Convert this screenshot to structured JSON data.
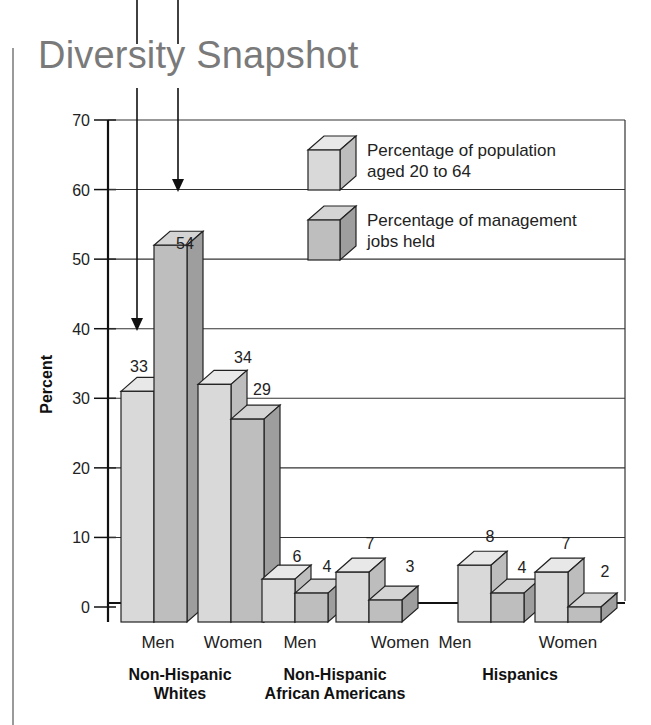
{
  "title": "Diversity Snapshot",
  "colors": {
    "pop_front": "#d9d9d9",
    "pop_top": "#e8e8e8",
    "pop_side": "#bdbdbd",
    "mgmt_front": "#bebebe",
    "mgmt_top": "#d4d4d4",
    "mgmt_side": "#9e9e9e",
    "stroke": "#222222"
  },
  "legend": [
    {
      "label_line1": "Percentage of population",
      "label_line2": "aged 20 to 64",
      "series": "population"
    },
    {
      "label_line1": "Percentage of management",
      "label_line2": "jobs held",
      "series": "management"
    }
  ],
  "chart_data": {
    "type": "bar",
    "title": "Diversity Snapshot",
    "xlabel": "",
    "ylabel": "Percent",
    "ylim": [
      0,
      70
    ],
    "yticks": [
      0,
      10,
      20,
      30,
      40,
      50,
      60,
      70
    ],
    "grid": true,
    "legend_position": "top-right",
    "groups": [
      {
        "name_line1": "Non-Hispanic",
        "name_line2": "Whites",
        "categories": [
          "Men",
          "Women"
        ]
      },
      {
        "name_line1": "Non-Hispanic",
        "name_line2": "African Americans",
        "categories": [
          "Men",
          "Women"
        ]
      },
      {
        "name_line1": "Hispanics",
        "name_line2": "",
        "categories": [
          "Men",
          "Women"
        ]
      }
    ],
    "categories": [
      "Non-Hispanic Whites - Men",
      "Non-Hispanic Whites - Women",
      "Non-Hispanic African Americans - Men",
      "Non-Hispanic African Americans - Women",
      "Hispanics - Men",
      "Hispanics - Women"
    ],
    "series": [
      {
        "name": "Percentage of population aged 20 to 64",
        "values": [
          33,
          34,
          6,
          7,
          8,
          7
        ]
      },
      {
        "name": "Percentage of management jobs held",
        "values": [
          54,
          29,
          4,
          3,
          4,
          2
        ]
      }
    ],
    "annotations": [
      "Arrows pointing to Non-Hispanic White Men bars (33 and 54)"
    ]
  }
}
